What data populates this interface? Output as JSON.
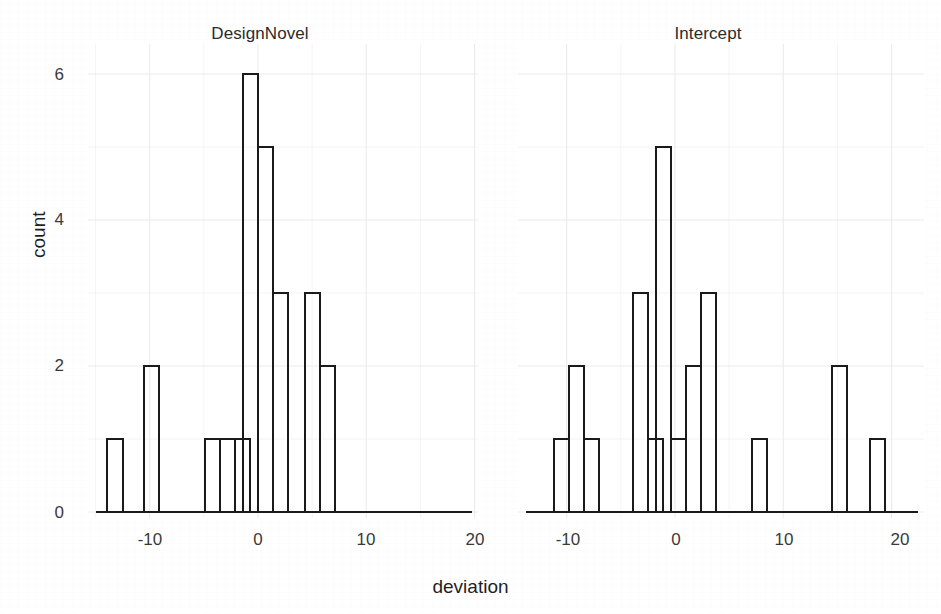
{
  "figure": {
    "x_axis_label": "deviation",
    "y_axis_label": "count",
    "y_ticks": [
      "0",
      "2",
      "4",
      "6"
    ],
    "x_ticks": [
      "-10",
      "0",
      "10",
      "20"
    ],
    "panel_titles": [
      "DesignNovel",
      "Intercept"
    ],
    "line_color": "#1a1a1a",
    "grid_color": "#ebebeb",
    "background": "#ffffff"
  },
  "chart_data": {
    "type": "bar",
    "title": "",
    "subtitle": "",
    "xlabel": "deviation",
    "ylabel": "count",
    "facets": [
      "DesignNovel",
      "Intercept"
    ],
    "xlim": [
      -14.5,
      20.5
    ],
    "ylim": [
      0,
      6.2
    ],
    "x_tick_values": [
      -10,
      0,
      10,
      20
    ],
    "y_tick_values": [
      0,
      2,
      4,
      6
    ],
    "grid": true,
    "legend": "none",
    "bin_width": 1.39,
    "panels": [
      {
        "name": "DesignNovel",
        "bin_centers": [
          -13.2,
          -9.8,
          -4.2,
          -2.8,
          -1.4,
          -0.7,
          0.7,
          2.1,
          5.0,
          6.4
        ],
        "bin_lefts": [
          -13.9,
          -10.5,
          -4.9,
          -3.5,
          -2.1,
          -1.4,
          0.0,
          1.4,
          4.3,
          5.7
        ],
        "values": [
          1,
          2,
          1,
          1,
          1,
          6,
          5,
          3,
          3,
          2
        ]
      },
      {
        "name": "Intercept",
        "bin_centers": [
          -10.5,
          -9.1,
          -7.7,
          -3.2,
          -1.8,
          -1.1,
          0.3,
          1.7,
          3.1,
          7.8,
          15.2,
          18.7
        ],
        "bin_lefts": [
          -11.2,
          -9.8,
          -8.4,
          -3.9,
          -2.5,
          -1.8,
          -0.4,
          1.0,
          2.4,
          7.1,
          14.5,
          18.0
        ],
        "values": [
          1,
          2,
          1,
          3,
          1,
          5,
          1,
          2,
          3,
          1,
          2,
          1
        ]
      }
    ]
  }
}
